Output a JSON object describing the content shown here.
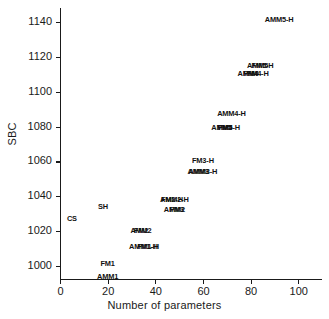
{
  "chart_data": {
    "type": "scatter",
    "title": "",
    "xlabel": "Number of parameters",
    "ylabel": "SBC",
    "xlim": [
      0,
      110
    ],
    "ylim": [
      1148,
      992
    ],
    "y_inverted": true,
    "grid": false,
    "legend": "none",
    "marker_style": "text-label",
    "xticks": [
      0,
      20,
      40,
      60,
      80,
      100
    ],
    "xticklabels": [
      "0",
      "20",
      "40",
      "60",
      "80",
      "100"
    ],
    "yticks": [
      1000,
      1020,
      1040,
      1060,
      1080,
      1100,
      1120,
      1140
    ],
    "yticklabels": [
      "1000",
      "1020",
      "1040",
      "1060",
      "1080",
      "1100",
      "1120",
      "1140"
    ],
    "points": [
      {
        "label": "AMM1",
        "x": 20,
        "y": 994
      },
      {
        "label": "FM1",
        "x": 20,
        "y": 1001
      },
      {
        "label": "CS",
        "x": 5,
        "y": 1027
      },
      {
        "label": "SH",
        "x": 18,
        "y": 1034
      },
      {
        "label": "AMM1-H",
        "x": 35,
        "y": 1011
      },
      {
        "label": "FM1-H",
        "x": 37,
        "y": 1011
      },
      {
        "label": "AMM2",
        "x": 34,
        "y": 1020
      },
      {
        "label": "FM2",
        "x": 34,
        "y": 1020
      },
      {
        "label": "AMM2",
        "x": 48,
        "y": 1032
      },
      {
        "label": "FM3",
        "x": 49,
        "y": 1032
      },
      {
        "label": "AMM2-H",
        "x": 48,
        "y": 1038
      },
      {
        "label": "FM2-H",
        "x": 47,
        "y": 1038
      },
      {
        "label": "AMM3",
        "x": 58,
        "y": 1054
      },
      {
        "label": "AMM3-H",
        "x": 60,
        "y": 1054
      },
      {
        "label": "FM3-H",
        "x": 60,
        "y": 1060
      },
      {
        "label": "AMM4",
        "x": 68,
        "y": 1079
      },
      {
        "label": "FM5",
        "x": 69,
        "y": 1079
      },
      {
        "label": "FM5-H",
        "x": 71,
        "y": 1079
      },
      {
        "label": "AMM4-H",
        "x": 72,
        "y": 1087
      },
      {
        "label": "AMM4",
        "x": 79,
        "y": 1110
      },
      {
        "label": "FM4",
        "x": 80,
        "y": 1110
      },
      {
        "label": "FM4-H",
        "x": 83,
        "y": 1110
      },
      {
        "label": "AMM5",
        "x": 83,
        "y": 1115
      },
      {
        "label": "FM5-H",
        "x": 85,
        "y": 1115
      },
      {
        "label": "AMM5-H",
        "x": 92,
        "y": 1141
      }
    ]
  }
}
